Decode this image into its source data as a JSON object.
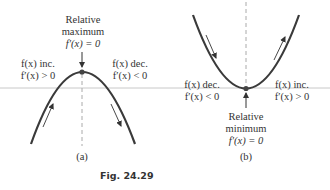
{
  "panel_a": {
    "label": "(a)",
    "top_title_line1": "Relative",
    "top_title_line2": "maximum",
    "top_title_line3": "f′(x) = 0",
    "left_line1": "f(x) inc.",
    "left_line2": "f′(x) > 0",
    "right_line1": "f(x) dec.",
    "right_line2": "f′(x) < 0"
  },
  "panel_b": {
    "label": "(b)",
    "left_line1": "f(x) dec.",
    "left_line2": "f′(x) < 0",
    "right_line1": "f(x) inc.",
    "right_line2": "f′(x) > 0",
    "bottom_title_line1": "Relative",
    "bottom_title_line2": "minimum",
    "bottom_title_line3": "f′(x) = 0"
  },
  "caption": "Fig. 24.29",
  "colors": {
    "curve": "#3a3a3a",
    "axis": "#c8c8c8",
    "dashed": "#aaaaaa",
    "text": "#333333"
  }
}
